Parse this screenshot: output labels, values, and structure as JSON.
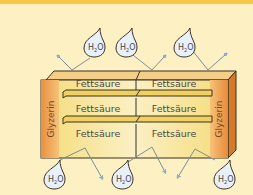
{
  "diagram": {
    "title": "",
    "colors": {
      "background": "#fdf1c4",
      "top_bar": "#f7c646",
      "glycerin_block": "#eea052",
      "fatty_acid_bar": "#f7e7a2",
      "arrow": "#8fb2d8",
      "drop_fill": "#e8f0fa",
      "outline": "#3d3020"
    },
    "glycerin_left": {
      "label": "Glyzerin"
    },
    "glycerin_right": {
      "label": "Glyzerin"
    },
    "fatty_acids": [
      {
        "row": 1,
        "left": "Fettsäure",
        "right": "Fettsäure"
      },
      {
        "row": 2,
        "left": "Fettsäure",
        "right": "Fettsäure"
      },
      {
        "row": 3,
        "left": "Fettsäure",
        "right": "Fettsäure"
      }
    ],
    "water_molecules": {
      "top": [
        {
          "label": "H",
          "sub": "2",
          "tail": "O"
        },
        {
          "label": "H",
          "sub": "2",
          "tail": "O"
        },
        {
          "label": "H",
          "sub": "2",
          "tail": "O"
        }
      ],
      "bottom": [
        {
          "label": "H",
          "sub": "2",
          "tail": "O"
        },
        {
          "label": "H",
          "sub": "2",
          "tail": "O"
        },
        {
          "label": "H",
          "sub": "2",
          "tail": "O"
        }
      ]
    }
  }
}
